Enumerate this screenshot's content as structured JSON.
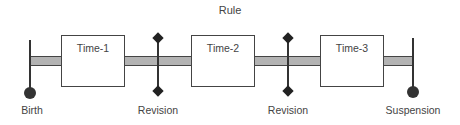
{
  "diagram": {
    "title": "Rule",
    "periods": [
      {
        "label": "Time-1"
      },
      {
        "label": "Time-2"
      },
      {
        "label": "Time-3"
      }
    ],
    "events": [
      {
        "label": "Birth",
        "marker": "circle"
      },
      {
        "label": "Revision",
        "marker": "diamond"
      },
      {
        "label": "Revision",
        "marker": "diamond"
      },
      {
        "label": "Suspension",
        "marker": "circle"
      }
    ],
    "colors": {
      "bar_fill": "#b3b3b3",
      "line": "#333333",
      "box_fill": "#ffffff"
    }
  }
}
